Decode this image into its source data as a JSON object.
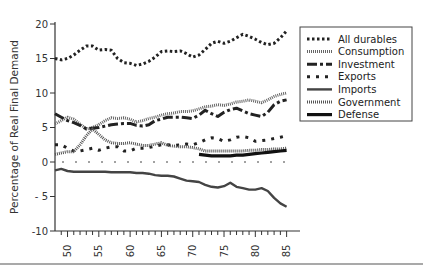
{
  "chart_data": {
    "type": "line",
    "title": "",
    "xlabel": "",
    "ylabel": "Percentage of Real Final Demand",
    "xlim": [
      48,
      86
    ],
    "ylim": [
      -10,
      20
    ],
    "x_ticks": [
      50,
      55,
      60,
      65,
      70,
      75,
      80,
      85
    ],
    "y_ticks": [
      20,
      15,
      10,
      5,
      0,
      -5,
      -10
    ],
    "y_tick_labels": [
      "20",
      "15",
      "10",
      "5",
      "0",
      "- 5",
      "-10"
    ],
    "grid": false,
    "legend_position": "upper right",
    "x": [
      48,
      49,
      50,
      51,
      52,
      53,
      54,
      55,
      56,
      57,
      58,
      59,
      60,
      61,
      62,
      63,
      64,
      65,
      66,
      67,
      68,
      69,
      70,
      71,
      72,
      73,
      74,
      75,
      76,
      77,
      78,
      79,
      80,
      81,
      82,
      83,
      84,
      85
    ],
    "series": [
      {
        "name": "All durables",
        "style": "dotted-heavy",
        "values": [
          15,
          14.8,
          15,
          15.5,
          16.2,
          16.8,
          16.8,
          16.2,
          16.3,
          16.2,
          15,
          14.4,
          14.3,
          14,
          14.2,
          14.6,
          15.2,
          16,
          16.1,
          16,
          16.1,
          15.7,
          15.2,
          15.5,
          16.3,
          17.2,
          17.5,
          17.2,
          17.5,
          18,
          18.5,
          18.2,
          17.8,
          17.3,
          17,
          17.2,
          18,
          19
        ]
      },
      {
        "name": "Consumption",
        "style": "dense-dotted",
        "values": [
          5.5,
          6,
          6.5,
          6.2,
          5.5,
          4.8,
          5,
          5.4,
          6,
          6.4,
          6.3,
          6.4,
          6.2,
          5.8,
          6,
          6.3,
          6.5,
          6.8,
          7,
          7.1,
          7.3,
          7.3,
          7.4,
          7.7,
          8,
          8.1,
          8.3,
          8.2,
          8.4,
          8.7,
          8.8,
          9,
          8.8,
          8.6,
          9,
          9.5,
          9.8,
          10
        ]
      },
      {
        "name": "Investment",
        "style": "dash-dot",
        "values": [
          7,
          6.5,
          6,
          5.7,
          5.3,
          4.8,
          4.9,
          5,
          5.2,
          5.4,
          5.5,
          5.6,
          5.6,
          5.3,
          5.2,
          5.4,
          6,
          6.2,
          6.5,
          6.5,
          6.5,
          6.4,
          6.3,
          6.8,
          7.5,
          7,
          6.6,
          7.2,
          7.6,
          7.8,
          7.4,
          7,
          6.8,
          6.6,
          7.2,
          8.3,
          8.8,
          9
        ]
      },
      {
        "name": "Exports",
        "style": "sparse-dotted",
        "values": [
          2.5,
          2.5,
          2,
          1.6,
          1.6,
          1.8,
          2,
          1.7,
          2,
          2.2,
          2.2,
          1.6,
          1.6,
          2,
          2,
          2.1,
          2.3,
          2.5,
          2.5,
          2.4,
          2.5,
          2.6,
          2.5,
          2.8,
          3.2,
          3.5,
          3.4,
          3,
          3.2,
          3.6,
          3.7,
          3.5,
          3,
          3.1,
          3.2,
          3.4,
          3.6,
          3.8
        ]
      },
      {
        "name": "Government",
        "style": "fine-dotted",
        "values": [
          1.1,
          1.3,
          1.5,
          1.5,
          2.5,
          3.8,
          4.8,
          4,
          3.2,
          2.8,
          2.7,
          2.7,
          2.8,
          2.6,
          2.4,
          2.4,
          2.6,
          2.8,
          2.4,
          2.3,
          2.2,
          2.2,
          2.1,
          1.9,
          1.6,
          1.6,
          1.6,
          1.6,
          1.6,
          1.6,
          1.6,
          1.7,
          1.7,
          1.8,
          1.8,
          1.9,
          1.9,
          2
        ]
      },
      {
        "name": "Defense",
        "style": "solid-heavy",
        "values": [
          null,
          null,
          null,
          null,
          null,
          null,
          null,
          null,
          null,
          null,
          null,
          null,
          null,
          null,
          null,
          null,
          null,
          null,
          null,
          null,
          null,
          null,
          null,
          1.1,
          1,
          0.9,
          0.9,
          0.9,
          0.9,
          1,
          1,
          1.1,
          1.2,
          1.3,
          1.4,
          1.5,
          1.6,
          1.7
        ]
      },
      {
        "name": "Imports",
        "style": "solid",
        "values": [
          -1.2,
          -1,
          -1.3,
          -1.4,
          -1.4,
          -1.4,
          -1.4,
          -1.4,
          -1.4,
          -1.5,
          -1.5,
          -1.5,
          -1.5,
          -1.6,
          -1.6,
          -1.7,
          -1.9,
          -2,
          -2,
          -2.1,
          -2.4,
          -2.7,
          -2.8,
          -2.9,
          -3.3,
          -3.6,
          -3.7,
          -3.5,
          -3,
          -3.6,
          -3.8,
          -4,
          -4,
          -3.8,
          -4.2,
          -5.2,
          -6,
          -6.5
        ]
      }
    ],
    "zero_reference": {
      "style": "dashed",
      "value": 0
    }
  },
  "legend": {
    "items": [
      {
        "label": "All durables",
        "style": "dotted-heavy"
      },
      {
        "label": "Consumption",
        "style": "dense-dotted"
      },
      {
        "label": "Investment",
        "style": "dash-dot"
      },
      {
        "label": "Exports",
        "style": "sparse-dotted"
      },
      {
        "label": "Imports",
        "style": "solid"
      },
      {
        "label": "Government",
        "style": "fine-dotted"
      },
      {
        "label": "Defense",
        "style": "solid-heavy"
      }
    ]
  },
  "colors": {
    "ink": "#222222",
    "gray": "#555555",
    "light": "#777777"
  }
}
